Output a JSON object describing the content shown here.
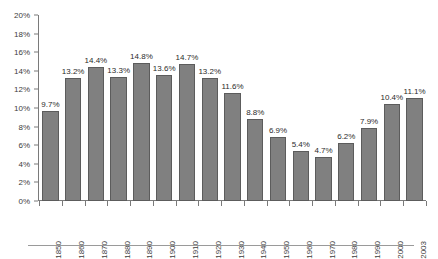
{
  "chart_data": {
    "type": "bar",
    "title": "",
    "subtitle": "",
    "xlabel": "",
    "ylabel": "",
    "categories": [
      "1850",
      "1860",
      "1870",
      "1880",
      "1890",
      "1900",
      "1910",
      "1920",
      "1930",
      "1940",
      "1950",
      "1960",
      "1970",
      "1980",
      "1990",
      "2000",
      "2003"
    ],
    "values": [
      9.7,
      13.2,
      14.4,
      13.3,
      14.8,
      13.6,
      14.7,
      13.2,
      11.6,
      8.8,
      6.9,
      5.4,
      4.7,
      6.2,
      7.9,
      10.4,
      11.1
    ],
    "data_labels": [
      "9.7%",
      "13.2%",
      "14.4%",
      "13.3%",
      "14.8%",
      "13.6%",
      "14.7%",
      "13.2%",
      "11.6%",
      "8.8%",
      "6.9%",
      "5.4%",
      "4.7%",
      "6.2%",
      "7.9%",
      "10.4%",
      "11.1%"
    ],
    "ylim": [
      0,
      20
    ],
    "ytick_values": [
      0,
      2,
      4,
      6,
      8,
      10,
      12,
      14,
      16,
      18,
      20
    ],
    "ytick_labels": [
      "0%",
      "2%",
      "4%",
      "6%",
      "8%",
      "10%",
      "12%",
      "14%",
      "16%",
      "18%",
      "20%"
    ],
    "grid": false,
    "legend": null,
    "legend_position": "none",
    "annotations": [],
    "series_color": "#808080",
    "series_border_color": "#5c5c5c",
    "axis_color": "#7a7a7a",
    "text_color": "#3d3d3d",
    "background": "#ffffff",
    "xlabel_rotation": 90
  }
}
